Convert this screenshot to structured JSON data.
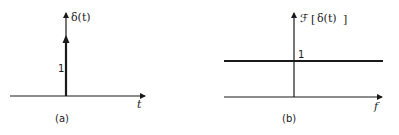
{
  "panels": [
    {
      "id": "a",
      "caption": "(a)",
      "y_label": "δ(t)",
      "x_label": "t",
      "impulse_label": "1",
      "description": "unit impulse at t = 0 with area 1"
    },
    {
      "id": "b",
      "caption": "(b)",
      "y_label_prefix": "ℱ",
      "y_label_open": "[",
      "y_label_inner": "δ(t)",
      "y_label_close": "]",
      "x_label": "f",
      "level_label": "1",
      "description": "constant spectrum equal to 1 for all f"
    }
  ]
}
